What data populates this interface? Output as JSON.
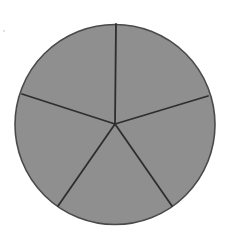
{
  "diagram": {
    "type": "fraction-circle",
    "shape": "circle",
    "divisions": 5,
    "equal_parts": true,
    "shaded_parts": 5,
    "center": [
      115,
      124
    ],
    "radius": 100,
    "spoke_endpoints": [
      [
        116,
        24
      ],
      [
        208,
        96
      ],
      [
        172,
        206
      ],
      [
        58,
        206
      ],
      [
        22,
        94
      ]
    ],
    "colors": {
      "fill": "#8f8f8f",
      "stroke": "#2e2e2e",
      "outline": "#4a4a4a",
      "background": "#ffffff"
    }
  },
  "chart_data": {
    "type": "pie",
    "categories": [
      "Part 1",
      "Part 2",
      "Part 3",
      "Part 4",
      "Part 5"
    ],
    "values": [
      20,
      20,
      20,
      20,
      20
    ],
    "title": "",
    "legend": "none"
  }
}
